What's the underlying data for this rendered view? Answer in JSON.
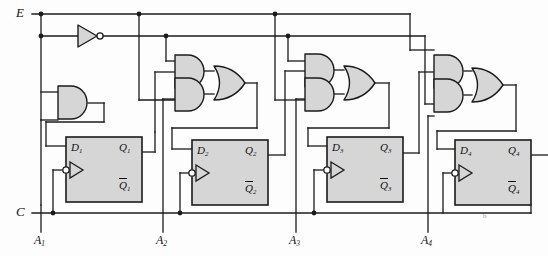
{
  "figure": {
    "kind": "logic-circuit-schematic",
    "stage_count": 4
  },
  "colors": {
    "wire": "#1b1b1b",
    "gate_fill": "#d6d6d6",
    "gate_stroke": "#1b1b1b",
    "flipflop_fill": "#d6d6d6",
    "flipflop_stroke": "#1b1b1b",
    "background": "#fdfdfd",
    "text": "#111111"
  },
  "inputs": {
    "enable": {
      "label": "E",
      "x": 22,
      "y": 14
    },
    "clock": {
      "label": "C",
      "x": 22,
      "y": 213
    },
    "data": [
      {
        "label": "A",
        "sub": "1",
        "x": 38,
        "y": 240
      },
      {
        "label": "A",
        "sub": "2",
        "x": 160,
        "y": 240
      },
      {
        "label": "A",
        "sub": "3",
        "x": 290,
        "y": 240
      },
      {
        "label": "A",
        "sub": "4",
        "x": 420,
        "y": 240
      }
    ]
  },
  "flipflops": [
    {
      "name": "ff1",
      "d": "D",
      "q": "Q",
      "qbar": "Q",
      "sub": "1",
      "x": 66,
      "y": 137,
      "w": 76,
      "h": 65
    },
    {
      "name": "ff2",
      "d": "D",
      "q": "Q",
      "qbar": "Q",
      "sub": "2",
      "x": 192,
      "y": 140,
      "w": 76,
      "h": 65
    },
    {
      "name": "ff3",
      "d": "D",
      "q": "Q",
      "qbar": "Q",
      "sub": "3",
      "x": 327,
      "y": 137,
      "w": 76,
      "h": 65
    },
    {
      "name": "ff4",
      "d": "D",
      "q": "Q",
      "qbar": "Q",
      "sub": "4",
      "x": 455,
      "y": 140,
      "w": 76,
      "h": 65
    }
  ],
  "gates": {
    "inverter": {
      "name": "enable-inverter",
      "type": "NOT",
      "x": 78,
      "y": 35
    },
    "and_gates": [
      {
        "name": "and-stage1",
        "stage": 1,
        "x": 58,
        "y": 86
      },
      {
        "name": "and-stage2-upper",
        "stage": 2,
        "x": 175,
        "y": 55
      },
      {
        "name": "and-stage2-lower",
        "stage": 2,
        "x": 175,
        "y": 88
      },
      {
        "name": "and-stage3-upper",
        "stage": 3,
        "x": 305,
        "y": 54
      },
      {
        "name": "and-stage3-lower",
        "stage": 3,
        "x": 305,
        "y": 88
      },
      {
        "name": "and-stage4-upper",
        "stage": 4,
        "x": 434,
        "y": 55
      },
      {
        "name": "and-stage4-lower",
        "stage": 4,
        "x": 434,
        "y": 88
      }
    ],
    "or_gates": [
      {
        "name": "or-stage2",
        "stage": 2,
        "x": 214,
        "y": 66
      },
      {
        "name": "or-stage3",
        "stage": 3,
        "x": 344,
        "y": 66
      },
      {
        "name": "or-stage4",
        "stage": 4,
        "x": 472,
        "y": 68
      }
    ]
  },
  "notes": {
    "stray_mark": "b"
  }
}
